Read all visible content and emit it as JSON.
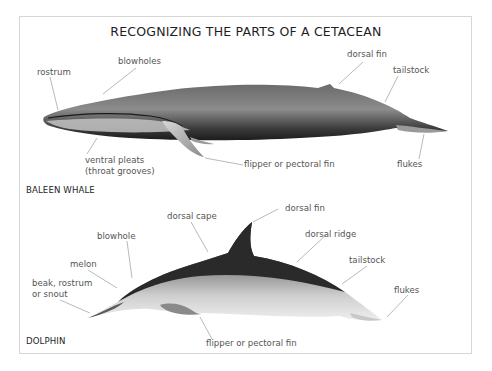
{
  "title": "RECOGNIZING THE PARTS OF A CETACEAN",
  "whale": {
    "section_label": "BALEEN WHALE",
    "labels": {
      "rostrum": "rostrum",
      "blowholes": "blowholes",
      "dorsal_fin": "dorsal fin",
      "tailstock": "tailstock",
      "ventral_pleats_1": "ventral pleats",
      "ventral_pleats_2": "(throat grooves)",
      "flipper": "flipper or pectoral fin",
      "flukes": "flukes"
    }
  },
  "dolphin": {
    "section_label": "DOLPHIN",
    "labels": {
      "dorsal_fin": "dorsal fin",
      "dorsal_cape": "dorsal cape",
      "dorsal_ridge": "dorsal ridge",
      "blowhole": "blowhole",
      "melon": "melon",
      "beak_1": "beak, rostrum",
      "beak_2": "or snout",
      "tailstock": "tailstock",
      "flukes": "flukes",
      "flipper": "flipper or pectoral fin"
    }
  },
  "colors": {
    "frame_border": "#d6d6d6",
    "label_text": "#555555",
    "leader_line": "#8a8a8a",
    "body_dark": "#2b2b2b",
    "body_mid": "#7a7a7a",
    "belly_light": "#d8d8d8"
  }
}
